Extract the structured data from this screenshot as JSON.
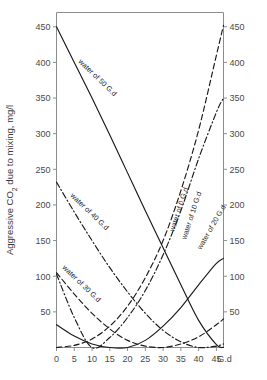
{
  "chart_data": {
    "type": "line",
    "title": "",
    "xlabel": "G.d",
    "ylabel": "Aggressive CO₂ due to mixing, mg/l",
    "x_unit_label": "G.d",
    "xlim": [
      0,
      47
    ],
    "ylim": [
      0,
      470
    ],
    "x_ticks": [
      "0",
      "5",
      "10",
      "15",
      "20",
      "25",
      "30",
      "35",
      "40",
      "45"
    ],
    "x_tick_values": [
      0,
      5,
      10,
      15,
      20,
      25,
      30,
      35,
      40,
      45
    ],
    "y_ticks": [
      "50",
      "100",
      "150",
      "200",
      "250",
      "300",
      "350",
      "400",
      "450"
    ],
    "y_tick_values": [
      50,
      100,
      150,
      200,
      250,
      300,
      350,
      400,
      450
    ],
    "right_axis_ticks": [
      "50",
      "100",
      "150",
      "200",
      "250",
      "300",
      "350",
      "400",
      "450"
    ],
    "grid": false,
    "legend_position": "inline-labels",
    "series": [
      {
        "name": "water of 0 G.d",
        "label": "water of 0 G.d",
        "style": "dashed",
        "minimum_at": 0,
        "x": [
          0,
          5,
          10,
          15,
          20,
          25,
          30,
          35,
          40,
          45,
          47
        ],
        "values": [
          0,
          3,
          12,
          30,
          58,
          98,
          150,
          220,
          305,
          410,
          452
        ]
      },
      {
        "name": "water of 10 G.d",
        "label": "water of 10 G.d",
        "style": "dash-dot",
        "minimum_at": 10,
        "x": [
          0,
          5,
          10,
          15,
          20,
          25,
          30,
          35,
          40,
          45,
          47
        ],
        "values": [
          103,
          42,
          0,
          14,
          42,
          80,
          130,
          192,
          265,
          330,
          350
        ]
      },
      {
        "name": "water of 20 G.d",
        "label": "water of 20 G.d",
        "style": "solid",
        "minimum_at": 20,
        "x": [
          0,
          5,
          10,
          15,
          20,
          25,
          30,
          35,
          40,
          45,
          47
        ],
        "values": [
          32,
          16,
          5,
          0,
          0,
          10,
          30,
          56,
          88,
          118,
          125
        ]
      },
      {
        "name": "water of 30 G.d",
        "label": "water of 30 G.d",
        "style": "dashed",
        "minimum_at": 30,
        "x": [
          0,
          5,
          10,
          15,
          20,
          25,
          30,
          35,
          40,
          45,
          47
        ],
        "values": [
          105,
          75,
          48,
          26,
          10,
          2,
          0,
          5,
          15,
          32,
          40
        ]
      },
      {
        "name": "water of 40 G.d",
        "label": "water of 40 G.d",
        "style": "dash-dot",
        "minimum_at": 40,
        "x": [
          0,
          5,
          10,
          15,
          20,
          25,
          30,
          35,
          40,
          45,
          47
        ],
        "values": [
          232,
          190,
          150,
          112,
          78,
          48,
          24,
          8,
          0,
          2,
          5
        ]
      },
      {
        "name": "water of 50 G.d",
        "label": "water of 50 G.d",
        "style": "solid",
        "minimum_at": 50,
        "x": [
          0,
          5,
          10,
          15,
          20,
          25,
          30,
          35,
          40,
          45,
          47
        ],
        "values": [
          450,
          400,
          350,
          298,
          245,
          192,
          140,
          88,
          38,
          4,
          0
        ]
      }
    ],
    "annotations": [
      {
        "text": "water of 50 G.d",
        "rotation": 44
      },
      {
        "text": "water of 40 G.d",
        "rotation": 44
      },
      {
        "text": "water of 30 G.d",
        "rotation": 44
      },
      {
        "text": "water of 0 G.d",
        "rotation": -72
      },
      {
        "text": "water of 10 G.d",
        "rotation": -72
      },
      {
        "text": "water of 20 G.d",
        "rotation": -60
      }
    ]
  }
}
